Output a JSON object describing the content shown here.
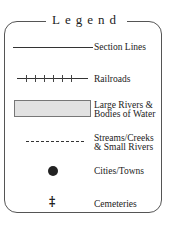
{
  "legend": {
    "title": "Legend",
    "items": [
      {
        "symbol": "solid-line",
        "label": "Section Lines"
      },
      {
        "symbol": "railroad-line",
        "label": "Railroads"
      },
      {
        "symbol": "gray-filled-rectangle",
        "label_line1": "Large Rivers &",
        "label_line2": "Bodies of Water"
      },
      {
        "symbol": "dashed-line",
        "label_line1": "Streams/Creeks",
        "label_line2": "& Small Rivers"
      },
      {
        "symbol": "filled-circle",
        "label": "Cities/Towns"
      },
      {
        "symbol": "cross-icon",
        "glyph": "‡",
        "label": "Cemeteries"
      }
    ],
    "colors": {
      "water_fill": "#e2e2e2",
      "stroke": "#333333"
    }
  }
}
